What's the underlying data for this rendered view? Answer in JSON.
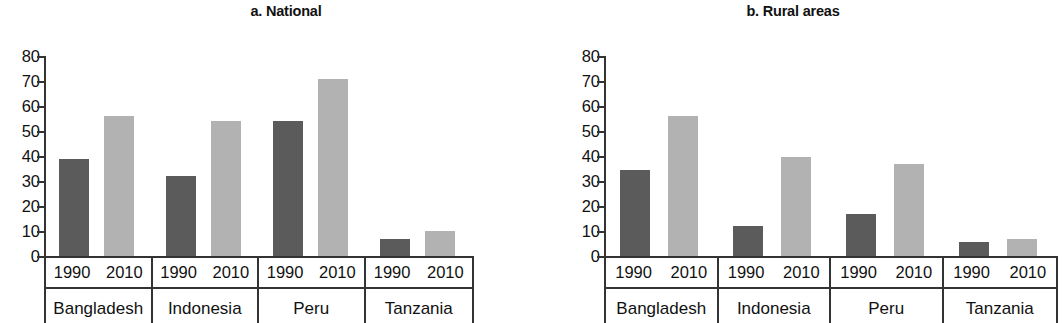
{
  "figure": {
    "axis_color": "#333333",
    "bar_colors": {
      "dark": "#5b5b5b",
      "light": "#b2b2b2"
    }
  },
  "panels": [
    {
      "key": "a",
      "title": "a. National"
    },
    {
      "key": "b",
      "title": "b. Rural areas"
    }
  ],
  "yticks": [
    "80",
    "70",
    "60",
    "50",
    "40",
    "30",
    "20",
    "10",
    "0"
  ],
  "years": [
    "1990",
    "2010"
  ],
  "countries": [
    "Bangladesh",
    "Indonesia",
    "Peru",
    "Tanzania"
  ],
  "chart_data": [
    {
      "type": "bar",
      "title": "a. National",
      "xlabel": "",
      "ylabel": "",
      "ylim": [
        0,
        80
      ],
      "yticks": [
        0,
        10,
        20,
        30,
        40,
        50,
        60,
        70,
        80
      ],
      "grid": false,
      "legend": "none",
      "categories": [
        "Bangladesh",
        "Indonesia",
        "Peru",
        "Tanzania"
      ],
      "series": [
        {
          "name": "1990",
          "color": "#5b5b5b",
          "values": [
            39,
            32,
            54,
            7
          ]
        },
        {
          "name": "2010",
          "color": "#b2b2b2",
          "values": [
            56,
            54,
            71,
            10
          ]
        }
      ]
    },
    {
      "type": "bar",
      "title": "b. Rural areas",
      "xlabel": "",
      "ylabel": "",
      "ylim": [
        0,
        80
      ],
      "yticks": [
        0,
        10,
        20,
        30,
        40,
        50,
        60,
        70,
        80
      ],
      "grid": false,
      "legend": "none",
      "categories": [
        "Bangladesh",
        "Indonesia",
        "Peru",
        "Tanzania"
      ],
      "series": [
        {
          "name": "1990",
          "color": "#5b5b5b",
          "values": [
            34.5,
            12,
            17,
            5.5
          ]
        },
        {
          "name": "2010",
          "color": "#b2b2b2",
          "values": [
            56,
            39.5,
            37,
            7
          ]
        }
      ]
    }
  ]
}
